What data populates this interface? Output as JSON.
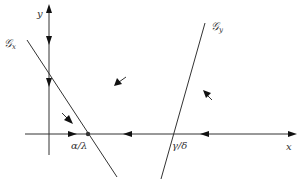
{
  "diagram": {
    "axes": {
      "x_label": "x",
      "y_label": "y"
    },
    "curves": [
      {
        "id": "Gx",
        "label_main": "𝒢",
        "label_sub": "x"
      },
      {
        "id": "Gy",
        "label_main": "𝒢",
        "label_sub": "y"
      }
    ],
    "points": [
      {
        "label": "α/λ"
      },
      {
        "label": "γ/δ"
      }
    ],
    "colors": {
      "stroke": "#333333",
      "arrowhead": "#111111",
      "background": "#ffffff"
    }
  }
}
